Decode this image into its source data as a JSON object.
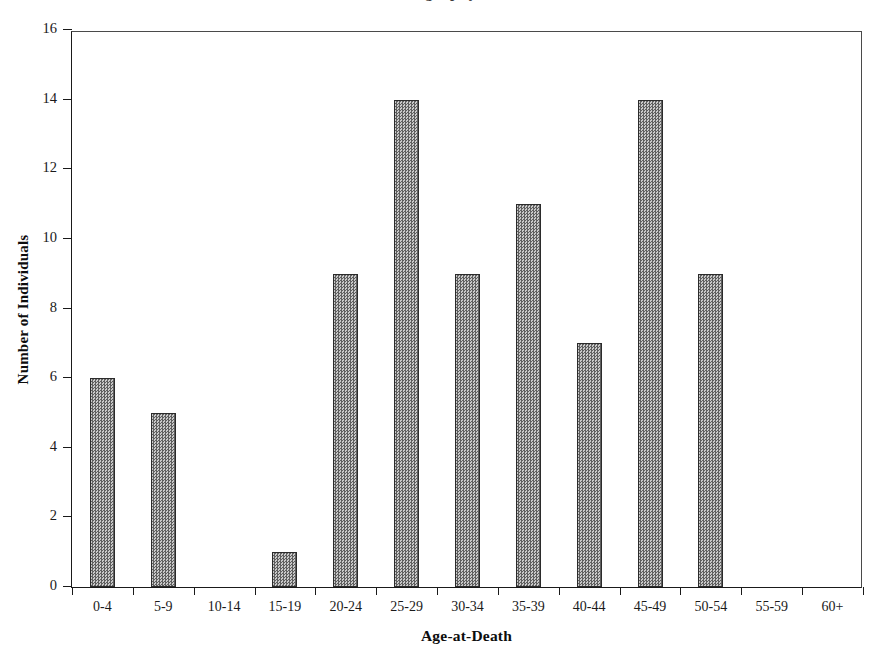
{
  "figure": {
    "caption_remnant": "osteobiography of the",
    "background_color": "#ffffff",
    "bar_fill_color": "#8a8a8a",
    "bar_edge_color": "#2b2b2b",
    "axis_color": "#1a1a1a"
  },
  "chart_data": {
    "type": "bar",
    "title": "",
    "xlabel": "Age-at-Death",
    "ylabel": "Number of Individuals",
    "categories": [
      "0-4",
      "5-9",
      "10-14",
      "15-19",
      "20-24",
      "25-29",
      "30-34",
      "35-39",
      "40-44",
      "45-49",
      "50-54",
      "55-59",
      "60+"
    ],
    "values": [
      6,
      5,
      0,
      1,
      9,
      14,
      9,
      11,
      7,
      14,
      9,
      0,
      0
    ],
    "ylim": [
      0,
      16
    ],
    "ytick_values": [
      0,
      2,
      4,
      6,
      8,
      10,
      12,
      14,
      16
    ],
    "ytick_labels": [
      "0",
      "2",
      "4",
      "6",
      "8",
      "10",
      "12",
      "14",
      "16"
    ],
    "grid": false,
    "legend": false,
    "legend_position": "none",
    "total_individuals": 85
  }
}
